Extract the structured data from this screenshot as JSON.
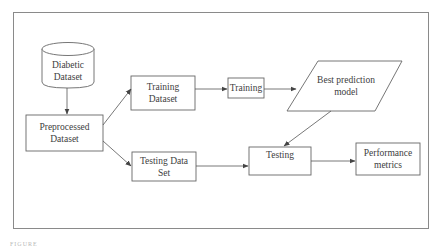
{
  "diagram": {
    "type": "flowchart",
    "nodes": {
      "diabetic_dataset": {
        "label": "Diabetic Dataset",
        "shape": "cylinder"
      },
      "preprocessed_dataset": {
        "label": "Preprocessed Dataset",
        "shape": "rectangle"
      },
      "training_dataset": {
        "label": "Training Dataset",
        "shape": "rectangle"
      },
      "training": {
        "label": "Training",
        "shape": "rectangle"
      },
      "best_model": {
        "label": "Best prediction model",
        "shape": "parallelogram"
      },
      "testing_dataset": {
        "label": "Testing Data Set",
        "shape": "rectangle"
      },
      "testing": {
        "label": "Testing",
        "shape": "rectangle"
      },
      "performance_metrics": {
        "label": "Performance metrics",
        "shape": "rectangle"
      }
    },
    "edges": [
      {
        "from": "Diabetic Dataset",
        "to": "Preprocessed Dataset"
      },
      {
        "from": "Preprocessed Dataset",
        "to": "Training Dataset"
      },
      {
        "from": "Preprocessed Dataset",
        "to": "Testing Data Set"
      },
      {
        "from": "Training Dataset",
        "to": "Training"
      },
      {
        "from": "Training",
        "to": "Best prediction model"
      },
      {
        "from": "Best prediction model",
        "to": "Testing"
      },
      {
        "from": "Testing Data Set",
        "to": "Testing"
      },
      {
        "from": "Testing",
        "to": "Performance metrics"
      }
    ],
    "colors": {
      "stroke": "#555555",
      "frame": "#8a8a8a",
      "text": "#404040",
      "background": "#ffffff"
    }
  },
  "caption": "FIGURE"
}
